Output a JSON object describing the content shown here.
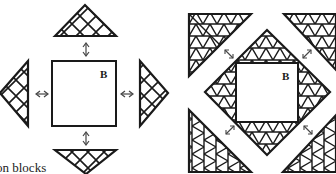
{
  "diagram": {
    "colors": {
      "line": "#1a1a1a",
      "background": "#ffffff",
      "arrow": "#444444"
    },
    "left_panel": {
      "center_square_label": "B",
      "pieces": [
        "top-triangle",
        "right-triangle",
        "bottom-triangle",
        "left-triangle"
      ],
      "arrows": [
        "up-down-arrow",
        "left-right-arrow",
        "up-down-arrow",
        "left-right-arrow"
      ]
    },
    "right_panel": {
      "center_square_label": "B",
      "corner_pieces": [
        "top-left-corner-triangle",
        "top-right-corner-triangle",
        "bottom-left-corner-triangle",
        "bottom-right-corner-triangle"
      ],
      "arrows": [
        "diagonal-arrow",
        "diagonal-arrow",
        "diagonal-arrow",
        "diagonal-arrow"
      ]
    },
    "caption": "on blocks"
  }
}
